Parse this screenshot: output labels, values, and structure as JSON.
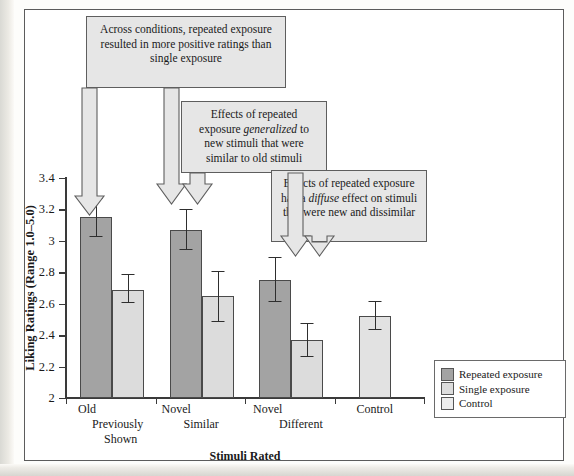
{
  "chart_data": {
    "type": "bar",
    "title": "",
    "xlabel": "Stimuli Rated",
    "ylabel": "Liking Ratings (Range 1.0–5.0)",
    "ylim": [
      2,
      3.4
    ],
    "yticks": [
      "2",
      "2.2",
      "2.4",
      "2.6",
      "2.8",
      "3",
      "3.2",
      "3.4"
    ],
    "ytick_values": [
      2,
      2.2,
      2.4,
      2.6,
      2.8,
      3.0,
      3.2,
      3.4
    ],
    "grid": false,
    "legend_position": "bottom-right",
    "categories": [
      {
        "line1": "Old",
        "line2": "Previously",
        "line3": "Shown"
      },
      {
        "line1": "Novel",
        "line2": "Similar",
        "line3": ""
      },
      {
        "line1": "Novel",
        "line2": "Different",
        "line3": ""
      },
      {
        "line1": "Control",
        "line2": "",
        "line3": ""
      }
    ],
    "series": [
      {
        "name": "Repeated exposure",
        "color": "#a3a3a3",
        "values": [
          3.15,
          3.07,
          2.75,
          null
        ],
        "err_low": [
          3.03,
          2.95,
          2.62,
          null
        ],
        "err_high": [
          3.27,
          3.2,
          2.9,
          null
        ]
      },
      {
        "name": "Single exposure",
        "color": "#dcdcdc",
        "values": [
          2.69,
          2.65,
          2.37,
          null
        ],
        "err_low": [
          2.61,
          2.49,
          2.27,
          null
        ],
        "err_high": [
          2.79,
          2.81,
          2.48,
          null
        ]
      },
      {
        "name": "Control",
        "color": "#ececec",
        "values": [
          null,
          null,
          null,
          2.52
        ],
        "err_low": [
          null,
          null,
          null,
          2.44
        ],
        "err_high": [
          null,
          null,
          null,
          2.62
        ]
      }
    ],
    "annotations": [
      {
        "id": "annotation-across-conditions",
        "text_parts": [
          {
            "t": "Across conditions, repeated exposure resulted in more positive ratings than single exposure",
            "i": false
          }
        ],
        "plain": "Across conditions, repeated exposure resulted in more positive ratings than single exposure"
      },
      {
        "id": "annotation-generalized",
        "text_parts": [
          {
            "t": "Effects of repeated exposure ",
            "i": false
          },
          {
            "t": "generalized",
            "i": true
          },
          {
            "t": " to new stimuli that were similar to old stimuli",
            "i": false
          }
        ],
        "plain": "Effects of repeated exposure generalized to new stimuli that were similar to old stimuli"
      },
      {
        "id": "annotation-diffuse",
        "text_parts": [
          {
            "t": "Effects of repeated exposure had a ",
            "i": false
          },
          {
            "t": "diffuse",
            "i": true
          },
          {
            "t": " effect on stimuli that were new and dissimilar",
            "i": false
          }
        ],
        "plain": "Effects of repeated exposure had a diffuse effect on stimuli that were new and dissimilar"
      }
    ]
  },
  "legend": {
    "items": [
      {
        "label": "Repeated exposure",
        "swatch": "repeated-exposure-swatch"
      },
      {
        "label": "Single exposure",
        "swatch": "single-exposure-swatch"
      },
      {
        "label": "Control",
        "swatch": "control-swatch"
      }
    ]
  },
  "colors": {
    "repeated": "#a3a3a3",
    "single": "#dcdcdc",
    "control": "#ececec",
    "callout_fill": "#e6e6e6",
    "frame": "#5c5c5c"
  }
}
